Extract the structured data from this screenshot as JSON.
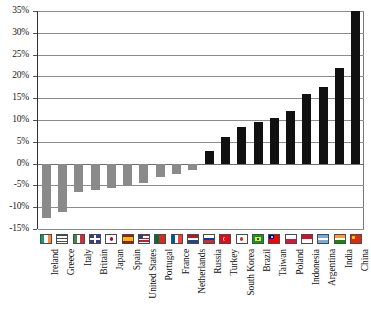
{
  "chart_data": {
    "type": "bar",
    "title": "",
    "subtitle": "",
    "xlabel": "",
    "ylabel": "",
    "ylim": [
      -15,
      35
    ],
    "ytick_step": 5,
    "ytick_labels": [
      "35%",
      "30%",
      "25%",
      "20%",
      "15%",
      "10%",
      "5%",
      "0%",
      "-5%",
      "-10%",
      "-15%"
    ],
    "ytick_values": [
      35,
      30,
      25,
      20,
      15,
      10,
      5,
      0,
      -5,
      -10,
      -15
    ],
    "grid": true,
    "legend": false,
    "categories": [
      "Ireland",
      "Greece",
      "Italy",
      "Britain",
      "Japan",
      "Spain",
      "United States",
      "Portugal",
      "France",
      "Netherlands",
      "Russia",
      "Turkey",
      "South Korea",
      "Brazil",
      "Taiwan",
      "Poland",
      "Indonesia",
      "Argentina",
      "India",
      "China"
    ],
    "values": [
      -12.5,
      -11.0,
      -6.5,
      -6.0,
      -5.5,
      -5.0,
      -4.5,
      -3.0,
      -2.5,
      -1.5,
      3.0,
      6.0,
      8.5,
      9.5,
      10.5,
      12.0,
      16.0,
      17.5,
      22.0,
      35.0
    ],
    "bar_colors": {
      "negative": "#8a8a8a",
      "positive": "#111111"
    }
  },
  "flags": [
    {
      "country": "Ireland",
      "icon": "flag-icon-ireland"
    },
    {
      "country": "Greece",
      "icon": "flag-icon-greece"
    },
    {
      "country": "Italy",
      "icon": "flag-icon-italy"
    },
    {
      "country": "Britain",
      "icon": "flag-icon-britain"
    },
    {
      "country": "Japan",
      "icon": "flag-icon-japan"
    },
    {
      "country": "Spain",
      "icon": "flag-icon-spain"
    },
    {
      "country": "United States",
      "icon": "flag-icon-united-states"
    },
    {
      "country": "Portugal",
      "icon": "flag-icon-portugal"
    },
    {
      "country": "France",
      "icon": "flag-icon-france"
    },
    {
      "country": "Netherlands",
      "icon": "flag-icon-netherlands"
    },
    {
      "country": "Russia",
      "icon": "flag-icon-russia"
    },
    {
      "country": "Turkey",
      "icon": "flag-icon-turkey"
    },
    {
      "country": "South Korea",
      "icon": "flag-icon-south-korea"
    },
    {
      "country": "Brazil",
      "icon": "flag-icon-brazil"
    },
    {
      "country": "Taiwan",
      "icon": "flag-icon-taiwan"
    },
    {
      "country": "Poland",
      "icon": "flag-icon-poland"
    },
    {
      "country": "Indonesia",
      "icon": "flag-icon-indonesia"
    },
    {
      "country": "Argentina",
      "icon": "flag-icon-argentina"
    },
    {
      "country": "India",
      "icon": "flag-icon-india"
    },
    {
      "country": "China",
      "icon": "flag-icon-china"
    }
  ]
}
